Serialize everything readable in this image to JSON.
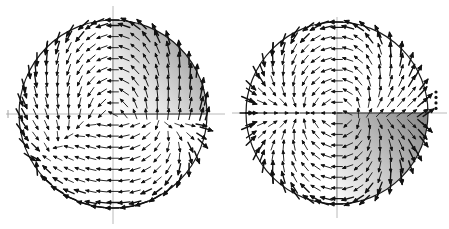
{
  "figure": {
    "type": "vector-field-pair",
    "background_color": "#ffffff",
    "width": 449,
    "height": 229,
    "title": "",
    "caption": ""
  },
  "chart_data": {
    "type": "scatter",
    "plot_kind": "quiver-vector-field",
    "title": "",
    "subtitle": "",
    "xlabel": "",
    "ylabel": "",
    "grid": false,
    "legend": null,
    "panel_count": 2,
    "shared_notes": "Two circular vector-field (quiver) diagrams, each with horizontal and vertical axis lines through the centre and one shaded quadrant with a grey gradient.",
    "panels": [
      {
        "name": "left-panel",
        "index": 0,
        "center": [
          113,
          114
        ],
        "radius": 94,
        "boundary_color": "#1a1a1a",
        "boundary_width": 1.2,
        "axes": {
          "horizontal_y": 114,
          "vertical_x": 113,
          "axis_color": "#a9a9a9",
          "horizontal_extends_left_to": 6,
          "horizontal_extends_right_to": 225,
          "vertical_extends_top_to": 6,
          "vertical_extends_bottom_to": 224,
          "tick_marks": [
            {
              "name": "left-axis-tick",
              "x": 8,
              "y": 114,
              "size": 6
            }
          ]
        },
        "shaded_region": {
          "quadrant": "upper-right",
          "gradient_from": "#ffffff",
          "gradient_to": "#8f8f8f",
          "gradient_direction": "to bottom right",
          "edge_color": "#2b2b2b"
        },
        "field": {
          "description": "Arrows rotate from pointing left on the left half to pointing up in the upper-right quadrant and down in the lower-right quadrant.",
          "grid_nx": 17,
          "grid_ny": 17,
          "arrow_color": "#111111",
          "arrow_scale": 10.5,
          "boundary_arrow_emphasis": true
        }
      },
      {
        "name": "right-panel",
        "index": 1,
        "center": [
          337,
          113
        ],
        "radius": 91,
        "boundary_color": "#1a1a1a",
        "boundary_width": 1.2,
        "axes": {
          "horizontal_y": 113,
          "vertical_x": 337,
          "axis_color": "#a9a9a9",
          "horizontal_extends_left_to": 232,
          "horizontal_extends_right_to": 447,
          "vertical_extends_top_to": 17,
          "vertical_extends_bottom_to": 218,
          "tick_marks": []
        },
        "shaded_region": {
          "quadrant": "lower-right",
          "gradient_from": "#ffffff",
          "gradient_to": "#8c8c8c",
          "gradient_direction": "to top right",
          "edge_color": "#2b2b2b"
        },
        "dotted_marker": {
          "name": "dotted-vertical-line",
          "x": 436,
          "y_start": 92,
          "y_end": 113,
          "dot_count": 4,
          "dot_radius": 1.6,
          "color": "#111111"
        },
        "field": {
          "description": "Arrows point left across the left half and rotate to point up-right in the upper-right quadrant and down-right in the lower-right shaded quadrant.",
          "grid_nx": 17,
          "grid_ny": 17,
          "arrow_color": "#111111",
          "arrow_scale": 10.5,
          "boundary_arrow_emphasis": true
        }
      }
    ]
  }
}
